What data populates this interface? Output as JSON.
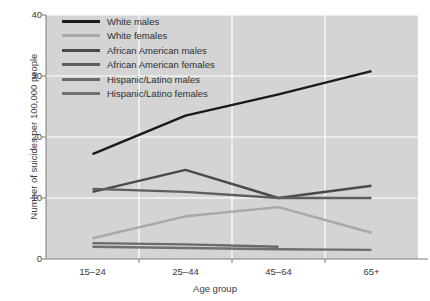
{
  "chart_data": {
    "type": "line",
    "title": "",
    "xlabel": "Age group",
    "ylabel": "Number of suicides per 100,000 people",
    "categories": [
      "15–24",
      "25–44",
      "45–64",
      "65+"
    ],
    "ylim": [
      0,
      40
    ],
    "yticks": [
      0,
      10,
      20,
      30,
      40
    ],
    "grid": true,
    "legend_position": "top-left",
    "plot_background": "#d4d4d4",
    "series": [
      {
        "name": "White males",
        "color": "#1a1a1a",
        "values": [
          17.2,
          23.5,
          27.0,
          30.8
        ]
      },
      {
        "name": "White females",
        "color": "#a8a8a8",
        "values": [
          3.4,
          7.0,
          8.5,
          4.3
        ]
      },
      {
        "name": "African American males",
        "color": "#4a4a4a",
        "values": [
          11.0,
          14.6,
          10.0,
          12.0
        ]
      },
      {
        "name": "African American females",
        "color": "#5e5e5e",
        "values": [
          11.5,
          11.0,
          10.0,
          10.0
        ]
      },
      {
        "name": "Hispanic/Latino males",
        "color": "#6a6a6a",
        "values": [
          2.6,
          2.4,
          2.0,
          null
        ]
      },
      {
        "name": "Hispanic/Latino females",
        "color": "#707070",
        "values": [
          2.0,
          1.8,
          1.6,
          1.5
        ]
      }
    ]
  }
}
